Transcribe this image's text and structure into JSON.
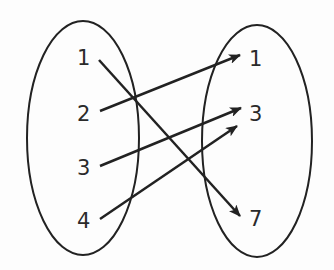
{
  "diagram": {
    "type": "mapping",
    "domain_set": {
      "elements": [
        "1",
        "2",
        "3",
        "4"
      ]
    },
    "range_set": {
      "elements": [
        "1",
        "3",
        "7"
      ]
    },
    "mappings": [
      {
        "from": "1",
        "to": "7"
      },
      {
        "from": "2",
        "to": "1"
      },
      {
        "from": "3",
        "to": "3"
      },
      {
        "from": "4",
        "to": "3"
      }
    ],
    "colors": {
      "stroke": "#222222",
      "text": "#2a2a2a",
      "background": "#fdfdfd"
    }
  }
}
